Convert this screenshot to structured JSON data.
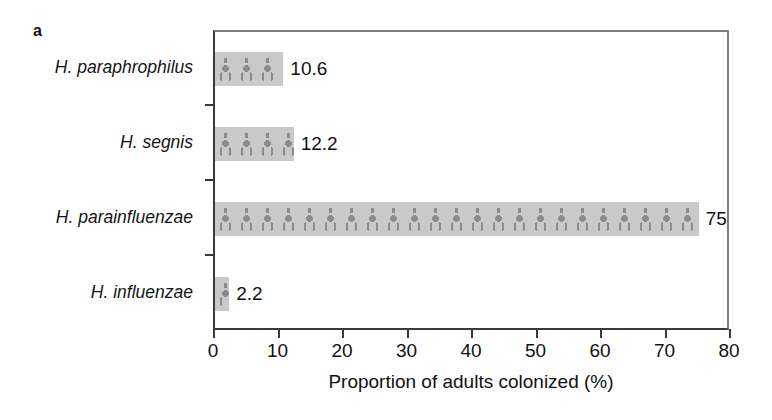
{
  "panel": {
    "letter": "a"
  },
  "chart_data": {
    "type": "bar",
    "orientation": "horizontal",
    "title": "",
    "subtitle": "",
    "xlabel": "Proportion of adults colonized (%)",
    "ylabel": "",
    "categories": [
      "H. paraphrophilus",
      "H. segnis",
      "H. parainfluenzae",
      "H. influenzae"
    ],
    "values": [
      10.6,
      12.2,
      75,
      2.2
    ],
    "value_labels": [
      "10.6",
      "12.2",
      "75",
      "2.2"
    ],
    "xlim": [
      0,
      80
    ],
    "xticks": [
      0,
      10,
      20,
      30,
      40,
      50,
      60,
      70,
      80
    ],
    "xticklabels": [
      "0",
      "10",
      "20",
      "30",
      "40",
      "50",
      "60",
      "70",
      "80"
    ],
    "grid": false,
    "legend": false,
    "bar_fill": "#c9c9c9",
    "bar_pattern": "person-icon-repeat",
    "pattern_color": "#8b8b8b",
    "axis_color": "#3a3a3a"
  }
}
